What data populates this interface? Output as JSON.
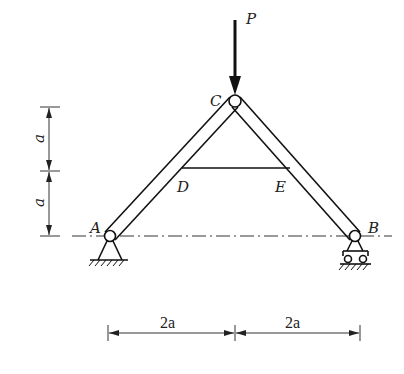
{
  "diagram": {
    "type": "truss-structure",
    "labels": {
      "load": "P",
      "apex": "C",
      "left_support": "A",
      "right_support": "B",
      "tie_left": "D",
      "tie_right": "E"
    },
    "dimensions": {
      "vertical_upper": "a",
      "vertical_lower": "a",
      "horizontal_left": "2a",
      "horizontal_right": "2a"
    },
    "supports": {
      "A": "pinned",
      "B": "roller"
    },
    "colors": {
      "line": "#111111",
      "dimension": "#333333",
      "background": "#ffffff"
    }
  }
}
